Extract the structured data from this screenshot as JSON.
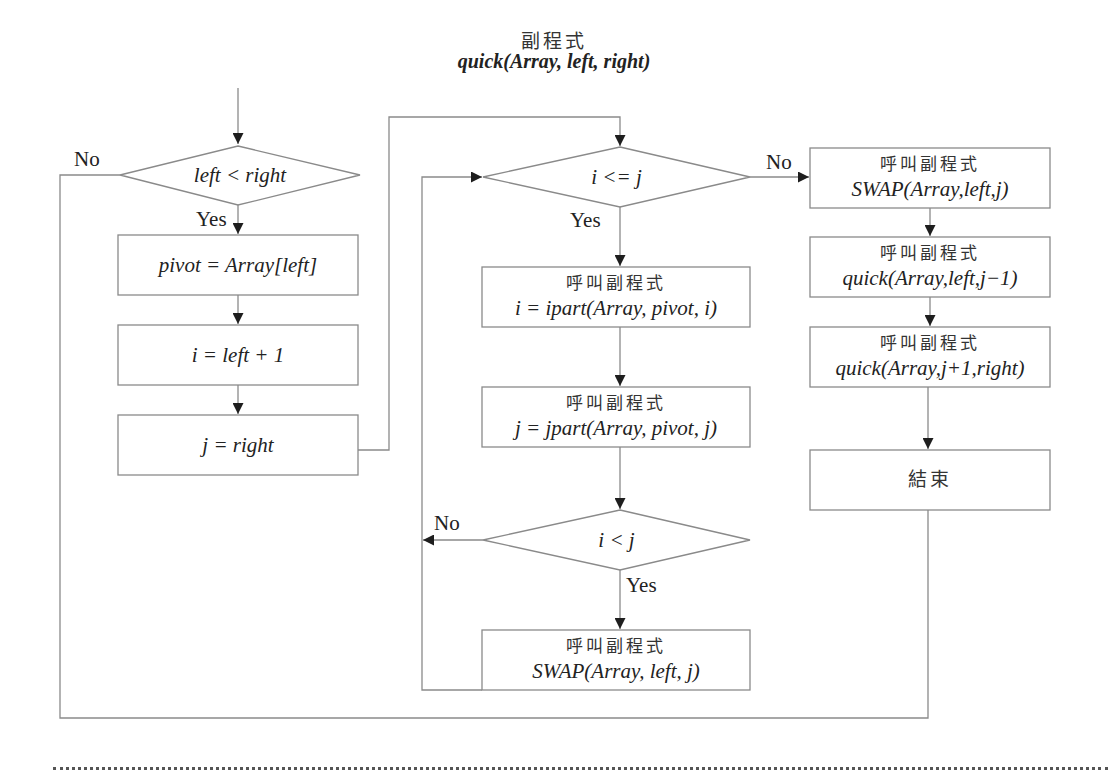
{
  "header": {
    "title_cn": "副程式",
    "title_fn": "quick(Array, left, right)"
  },
  "nodes": {
    "cond_left_right": {
      "type": "decision",
      "text": "left < right"
    },
    "assign_pivot": {
      "type": "process",
      "text": "pivot = Array[left]"
    },
    "assign_i": {
      "type": "process",
      "text": "i = left + 1"
    },
    "assign_j": {
      "type": "process",
      "text": "j = right"
    },
    "cond_i_le_j": {
      "type": "decision",
      "text": "i <= j"
    },
    "call_ipart": {
      "type": "process",
      "caption": "呼叫副程式",
      "text": "i = ipart(Array, pivot, i)"
    },
    "call_jpart": {
      "type": "process",
      "caption": "呼叫副程式",
      "text": "j = jpart(Array, pivot, j)"
    },
    "cond_i_lt_j": {
      "type": "decision",
      "text": "i < j"
    },
    "call_swap_loop": {
      "type": "process",
      "caption": "呼叫副程式",
      "text": "SWAP(Array, left, j)"
    },
    "call_swap_end": {
      "type": "process",
      "caption": "呼叫副程式",
      "text": "SWAP(Array,left,j)"
    },
    "call_quick_left": {
      "type": "process",
      "caption": "呼叫副程式",
      "text": "quick(Array,left,j−1)"
    },
    "call_quick_right": {
      "type": "process",
      "caption": "呼叫副程式",
      "text": "quick(Array,j+1,right)"
    },
    "end": {
      "type": "terminal",
      "text": "結束"
    }
  },
  "edge_labels": {
    "cond1_no": "No",
    "cond1_yes": "Yes",
    "cond2_no": "No",
    "cond2_yes": "Yes",
    "cond3_no": "No",
    "cond3_yes": "Yes"
  },
  "colors": {
    "stroke": "#8a8a8a",
    "arrow": "#1e1e1e",
    "text": "#222222"
  }
}
